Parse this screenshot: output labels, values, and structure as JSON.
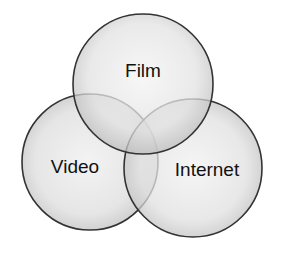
{
  "diagram": {
    "type": "venn",
    "sets": [
      {
        "id": "film",
        "label": "Film",
        "cx": 143,
        "cy": 84,
        "r": 70
      },
      {
        "id": "video",
        "label": "Video",
        "cx": 90,
        "cy": 162,
        "r": 68
      },
      {
        "id": "internet",
        "label": "Internet",
        "cx": 193,
        "cy": 168,
        "r": 69
      }
    ],
    "colors": {
      "fill_center": "#f2f2f2",
      "fill_edge": "#c4c4c4",
      "stroke": "#333333",
      "overlap_shade": "#000000",
      "text": "#111111"
    }
  }
}
